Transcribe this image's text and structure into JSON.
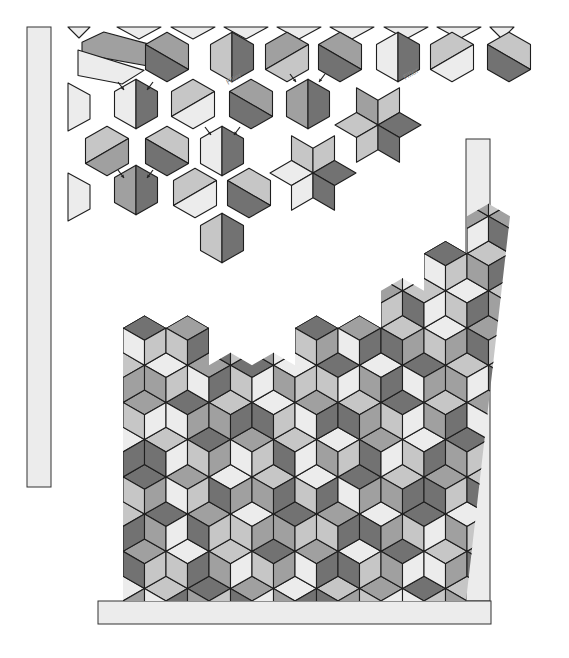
{
  "diagram": {
    "shades": {
      "0": "#ececec",
      "1": "#c6c6c6",
      "2": "#a0a0a0",
      "3": "#727272"
    },
    "stroke_color": "#1e1e1e",
    "hex_radius": 24.8,
    "labels": [
      {
        "text": "Filler",
        "x": 228,
        "y": 85,
        "rotate": -30
      },
      {
        "text": "Filler",
        "x": 405,
        "y": 80,
        "rotate": -30
      }
    ],
    "bars": [
      {
        "name": "left-vertical-bar",
        "x": 27,
        "y": 27,
        "w": 24,
        "h": 460
      },
      {
        "name": "right-vertical-bar",
        "x": 466,
        "y": 139,
        "w": 24,
        "h": 462
      },
      {
        "name": "bottom-horizontal-bar",
        "x": 98,
        "y": 601,
        "w": 393,
        "h": 23
      }
    ],
    "loose_hexes": [
      {
        "cx": 167,
        "cy": 57,
        "split": "diag-up",
        "a": 2,
        "b": 3
      },
      {
        "cx": 232,
        "cy": 57,
        "split": "vertical",
        "a": 1,
        "b": 3
      },
      {
        "cx": 287,
        "cy": 57,
        "split": "diag-down",
        "a": 2,
        "b": 1
      },
      {
        "cx": 340,
        "cy": 57,
        "split": "diag-up",
        "a": 2,
        "b": 3
      },
      {
        "cx": 398,
        "cy": 57,
        "split": "vertical",
        "a": 0,
        "b": 3
      },
      {
        "cx": 452,
        "cy": 57,
        "split": "diag-down",
        "a": 1,
        "b": 0
      },
      {
        "cx": 509,
        "cy": 57,
        "split": "diag-up",
        "a": 1,
        "b": 3
      },
      {
        "cx": 136,
        "cy": 104,
        "split": "vertical",
        "a": 0,
        "b": 3
      },
      {
        "cx": 193,
        "cy": 104,
        "split": "diag-down",
        "a": 1,
        "b": 0
      },
      {
        "cx": 251,
        "cy": 104,
        "split": "diag-up",
        "a": 2,
        "b": 3
      },
      {
        "cx": 308,
        "cy": 104,
        "split": "vertical",
        "a": 2,
        "b": 3
      },
      {
        "cx": 107,
        "cy": 151,
        "split": "diag-down",
        "a": 1,
        "b": 2
      },
      {
        "cx": 167,
        "cy": 151,
        "split": "diag-up",
        "a": 1,
        "b": 3
      },
      {
        "cx": 222,
        "cy": 151,
        "split": "vertical",
        "a": 0,
        "b": 3
      },
      {
        "cx": 136,
        "cy": 190,
        "split": "vertical",
        "a": 2,
        "b": 3
      },
      {
        "cx": 195,
        "cy": 193,
        "split": "diag-down",
        "a": 1,
        "b": 0
      },
      {
        "cx": 249,
        "cy": 193,
        "split": "diag-up",
        "a": 1,
        "b": 3
      },
      {
        "cx": 222,
        "cy": 238,
        "split": "vertical",
        "a": 1,
        "b": 3
      }
    ],
    "loose_trefoils": [
      {
        "cx": 378,
        "cy": 125,
        "top_left": 2,
        "top_right": 1,
        "left": 1,
        "right": 3,
        "bottom_left": 1,
        "bottom_right": 3
      },
      {
        "cx": 313,
        "cy": 173,
        "top_left": 1,
        "top_right": 1,
        "left": 0,
        "right": 3,
        "bottom_left": 0,
        "bottom_right": 3
      }
    ],
    "arrows": [
      {
        "x1": 118,
        "y1": 82,
        "x2": 124,
        "y2": 90
      },
      {
        "x1": 153,
        "y1": 82,
        "x2": 147,
        "y2": 90
      },
      {
        "x1": 205,
        "y1": 127,
        "x2": 211,
        "y2": 135
      },
      {
        "x1": 240,
        "y1": 127,
        "x2": 234,
        "y2": 135
      },
      {
        "x1": 290,
        "y1": 74,
        "x2": 296,
        "y2": 82
      },
      {
        "x1": 325,
        "y1": 74,
        "x2": 319,
        "y2": 82
      },
      {
        "x1": 118,
        "y1": 170,
        "x2": 124,
        "y2": 178
      },
      {
        "x1": 153,
        "y1": 170,
        "x2": 147,
        "y2": 178
      }
    ],
    "edge_pieces": [
      {
        "type": "tri-down",
        "x": 68,
        "y": 27,
        "w": 22,
        "h": 11,
        "shade": 0
      },
      {
        "type": "tri-down",
        "x": 117,
        "y": 27,
        "w": 44,
        "h": 12,
        "shade": 0
      },
      {
        "type": "tri-down",
        "x": 171,
        "y": 27,
        "w": 44,
        "h": 12,
        "shade": 0
      },
      {
        "type": "tri-down",
        "x": 224,
        "y": 27,
        "w": 44,
        "h": 12,
        "shade": 0
      },
      {
        "type": "tri-down",
        "x": 277,
        "y": 27,
        "w": 44,
        "h": 12,
        "shade": 0
      },
      {
        "type": "tri-down",
        "x": 330,
        "y": 27,
        "w": 44,
        "h": 12,
        "shade": 0
      },
      {
        "type": "tri-down",
        "x": 384,
        "y": 27,
        "w": 44,
        "h": 12,
        "shade": 0
      },
      {
        "type": "tri-down",
        "x": 437,
        "y": 27,
        "w": 44,
        "h": 12,
        "shade": 0
      },
      {
        "type": "tri-down",
        "x": 490,
        "y": 27,
        "w": 24,
        "h": 12,
        "shade": 0
      },
      {
        "type": "trap-left",
        "x": 68,
        "y": 83,
        "w": 22,
        "h": 48,
        "shade": 0
      },
      {
        "type": "trap-left",
        "x": 68,
        "y": 173,
        "w": 22,
        "h": 48,
        "shade": 0
      },
      {
        "type": "para",
        "x": 82,
        "y": 32,
        "w": 66,
        "h": 34,
        "shade": 2
      },
      {
        "type": "para2",
        "x": 78,
        "y": 50,
        "w": 66,
        "h": 34,
        "shade": 0
      }
    ],
    "block": {
      "x": 123,
      "y": 298,
      "w": 343,
      "h": 303,
      "origin_x": 123,
      "origin_y": 601,
      "cols": 9,
      "rows": 9,
      "col_heights": [
        8,
        8,
        7,
        7,
        8,
        8,
        9,
        10,
        11
      ],
      "cells": [
        [
          [
            0,
            1,
            2
          ],
          [
            1,
            0,
            3
          ],
          [
            3,
            2,
            1
          ],
          [
            2,
            3,
            0
          ],
          [
            0,
            2,
            3
          ],
          [
            1,
            3,
            2
          ],
          [
            2,
            1,
            0
          ],
          [
            3,
            0,
            1
          ],
          [
            1,
            2,
            3
          ]
        ],
        [
          [
            2,
            3,
            1
          ],
          [
            0,
            1,
            3
          ],
          [
            1,
            2,
            0
          ],
          [
            3,
            1,
            2
          ],
          [
            2,
            0,
            3
          ],
          [
            0,
            3,
            1
          ],
          [
            3,
            2,
            0
          ],
          [
            1,
            0,
            2
          ],
          [
            2,
            3,
            0
          ]
        ],
        [
          [
            1,
            0,
            3
          ],
          [
            3,
            2,
            0
          ],
          [
            2,
            3,
            1
          ],
          [
            0,
            1,
            2
          ],
          [
            3,
            2,
            1
          ],
          [
            2,
            1,
            3
          ],
          [
            0,
            3,
            2
          ],
          [
            3,
            1,
            0
          ],
          [
            0,
            2,
            1
          ]
        ],
        [
          [
            3,
            1,
            2
          ],
          [
            2,
            0,
            1
          ],
          [
            0,
            3,
            2
          ],
          [
            1,
            2,
            3
          ],
          [
            0,
            1,
            3
          ],
          [
            3,
            0,
            2
          ],
          [
            1,
            2,
            3
          ],
          [
            2,
            3,
            1
          ],
          [
            1,
            3,
            2
          ]
        ],
        [
          [
            0,
            2,
            3
          ],
          [
            1,
            3,
            0
          ],
          [
            3,
            1,
            2
          ],
          [
            2,
            0,
            1
          ],
          [
            1,
            3,
            0
          ],
          [
            0,
            2,
            1
          ],
          [
            2,
            3,
            0
          ],
          [
            0,
            1,
            3
          ],
          [
            3,
            2,
            1
          ]
        ],
        [
          [
            2,
            1,
            0
          ],
          [
            3,
            0,
            2
          ],
          [
            1,
            2,
            3
          ],
          [
            0,
            3,
            1
          ],
          [
            2,
            0,
            3
          ],
          [
            1,
            3,
            2
          ],
          [
            3,
            1,
            0
          ],
          [
            1,
            2,
            3
          ],
          [
            2,
            0,
            3
          ]
        ],
        [
          [
            1,
            3,
            2
          ],
          [
            0,
            2,
            1
          ],
          [
            2,
            0,
            3
          ],
          [
            3,
            1,
            0
          ],
          [
            0,
            2,
            1
          ],
          [
            3,
            1,
            0
          ],
          [
            0,
            2,
            3
          ],
          [
            3,
            0,
            2
          ],
          [
            1,
            2,
            0
          ]
        ],
        [
          [
            3,
            0,
            1
          ],
          [
            2,
            1,
            3
          ],
          [
            0,
            3,
            1
          ],
          [
            1,
            2,
            0
          ],
          [
            3,
            1,
            2
          ],
          [
            2,
            0,
            3
          ],
          [
            1,
            3,
            2
          ],
          [
            0,
            1,
            2
          ],
          [
            2,
            3,
            1
          ]
        ],
        [
          [
            1,
            2,
            3
          ],
          [
            3,
            2,
            1
          ],
          [
            2,
            1,
            0
          ],
          [
            0,
            3,
            2
          ],
          [
            1,
            2,
            0
          ],
          [
            0,
            1,
            2
          ],
          [
            2,
            0,
            1
          ],
          [
            1,
            3,
            0
          ],
          [
            0,
            1,
            3
          ]
        ]
      ]
    }
  }
}
